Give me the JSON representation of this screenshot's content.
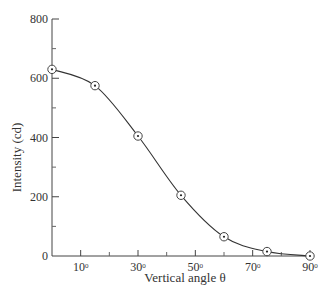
{
  "chart_data": {
    "type": "line",
    "title": "",
    "xlabel": "Vertical angle θ",
    "ylabel": "Intensity (cd)",
    "xlim": [
      0,
      90
    ],
    "ylim": [
      0,
      800
    ],
    "x_ticks": [
      10,
      30,
      50,
      70,
      90
    ],
    "x_tick_labels": [
      "10°",
      "30°",
      "50°",
      "70°",
      "90°"
    ],
    "x_minor_ticks": [
      20,
      40,
      60,
      80
    ],
    "y_ticks": [
      0,
      200,
      400,
      600,
      800
    ],
    "y_tick_labels": [
      "0",
      "200",
      "400",
      "600",
      "800"
    ],
    "y_minor_ticks": [
      100,
      300,
      500,
      700
    ],
    "grid": false,
    "legend": null,
    "series": [
      {
        "name": "Intensity",
        "marker": "circled-dot",
        "x": [
          0,
          15,
          30,
          45,
          60,
          75,
          90
        ],
        "y": [
          630,
          575,
          405,
          205,
          65,
          15,
          0
        ]
      }
    ]
  }
}
